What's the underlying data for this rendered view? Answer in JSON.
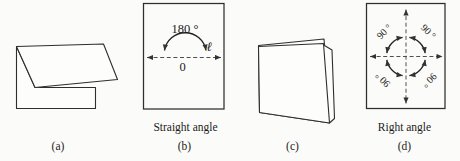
{
  "figure": {
    "panels": {
      "a": {
        "caption": "(a)"
      },
      "b": {
        "caption": "(b)",
        "title": "Straight angle",
        "angle_label": "180 °",
        "vertex_label": "0",
        "line_label": "ℓ"
      },
      "c": {
        "caption": "(c)"
      },
      "d": {
        "caption": "(d)",
        "title": "Right angle",
        "angle_labels": {
          "top_left": "90 °",
          "top_right": "90 °",
          "bottom_left": "90 °",
          "bottom_right": "90 °"
        }
      }
    },
    "colors": {
      "line": "#2e2e2e",
      "dashed": "#4f4f4f",
      "text": "#1b1b1b",
      "background": "#fbfbf9"
    }
  }
}
